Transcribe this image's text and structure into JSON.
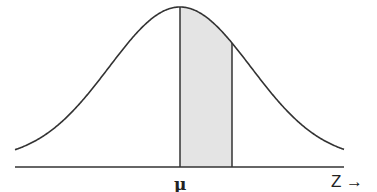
{
  "diagram": {
    "type": "normal-distribution-curve",
    "labels": {
      "mean": "μ",
      "axis": "Z →"
    },
    "curve": {
      "mean_x": 180,
      "peak_y": 7,
      "sigma_px": 71,
      "asymptote_y": 160,
      "x_start": 15,
      "x_end": 344
    },
    "shaded_region": {
      "from_x": 180,
      "to_x": 232,
      "fill": "#e4e4e4"
    },
    "baseline": {
      "y": 167,
      "x_start": 15,
      "x_end": 344
    },
    "colors": {
      "stroke": "#333333",
      "shade": "#e4e4e4",
      "background": "#ffffff"
    }
  }
}
